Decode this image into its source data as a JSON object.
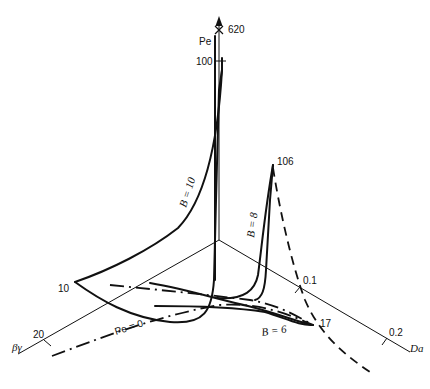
{
  "diagram": {
    "axes": {
      "vertical": {
        "label": "Pe",
        "tick_label": "100",
        "top_marker_label": "620"
      },
      "left": {
        "label": "βγ",
        "tick_labels": [
          "10",
          "20"
        ]
      },
      "right": {
        "label": "Da",
        "tick_labels": [
          "0.1",
          "0.2"
        ]
      }
    },
    "curves": [
      {
        "id": "B10",
        "label": "B = 10",
        "style": "solid"
      },
      {
        "id": "B8",
        "label": "B = 8",
        "style": "solid",
        "peak_label": "106"
      },
      {
        "id": "B6",
        "label": "B = 6",
        "style": "solid",
        "end_label": "17"
      },
      {
        "id": "Pe0",
        "label": "Pe = 0",
        "style": "dash-dot"
      },
      {
        "id": "dashed",
        "label": "",
        "style": "dashed"
      }
    ]
  }
}
